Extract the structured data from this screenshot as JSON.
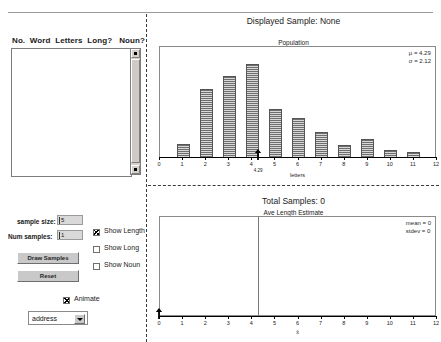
{
  "window": {
    "title": "Sampling Words Simulation"
  },
  "word_table": {
    "headers": [
      "No.",
      "Word",
      "Letters",
      "Long?",
      "Noun?"
    ],
    "header_line": "No.  Word  Letters Long?   Noun?",
    "rows": [],
    "scrollbar": {
      "up_icon": "scroll-up-icon",
      "down_icon": "scroll-down-icon"
    }
  },
  "population_panel": {
    "displayed_sample_label": "Displayed Sample: None",
    "chart_title": "Population",
    "mu_text": "μ = 4.29",
    "sigma_text": "σ = 2.12",
    "mean_marker_value": "4.29"
  },
  "estimate_panel": {
    "total_samples_label": "Total Samples: 0",
    "chart_title": "Ave Length Estimate",
    "mean_text": "mean = 0",
    "stdev_text": "stdev = 0",
    "mean_marker_value": "0"
  },
  "controls": {
    "sample_size_label": "sample size:",
    "sample_size_value": "5",
    "num_samples_label": "Num samples:",
    "num_samples_value": "1",
    "draw_samples_label": "Draw Samples",
    "reset_label": "Reset",
    "checkboxes": [
      {
        "label": "Show Length",
        "checked": true
      },
      {
        "label": "Show Long",
        "checked": false
      },
      {
        "label": "Show Noun",
        "checked": false
      }
    ],
    "animate_label": "Animate",
    "animate_checked": true,
    "dataset_select": {
      "value": "address",
      "options": [
        "address"
      ],
      "arrow_icon": "chevron-down-icon"
    }
  },
  "chart_data": [
    {
      "type": "bar",
      "id": "population-histogram",
      "title": "Population",
      "xlabel": "letters",
      "ylabel": "",
      "categories": [
        1,
        2,
        3,
        4,
        5,
        6,
        7,
        8,
        9,
        10,
        11
      ],
      "values": [
        0.115,
        0.615,
        0.735,
        0.845,
        0.435,
        0.355,
        0.225,
        0.105,
        0.165,
        0.065,
        0.048
      ],
      "xlim": [
        0,
        12
      ],
      "xticks": [
        0,
        1,
        2,
        3,
        4,
        5,
        6,
        7,
        8,
        9,
        10,
        11,
        12
      ],
      "grid": false,
      "legend": false,
      "annotations": [
        "μ = 4.29",
        "σ = 2.12"
      ],
      "mean_marker": 4.29
    },
    {
      "type": "bar",
      "id": "ave-length-estimate",
      "title": "Ave Length Estimate",
      "xlabel": "x̄",
      "ylabel": "",
      "categories": [],
      "values": [],
      "xlim": [
        0,
        12
      ],
      "xticks": [
        0,
        1,
        2,
        3,
        4,
        5,
        6,
        7,
        8,
        9,
        10,
        11,
        12
      ],
      "grid": false,
      "legend": false,
      "annotations": [
        "mean = 0",
        "stdev = 0"
      ],
      "mean_marker": 4.29
    }
  ]
}
